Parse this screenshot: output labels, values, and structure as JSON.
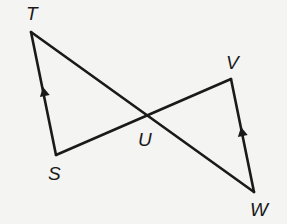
{
  "figure": {
    "type": "geometry",
    "points": {
      "T": {
        "label": "T",
        "x": 31,
        "y": 32,
        "label_x": 26,
        "label_y": 20
      },
      "S": {
        "label": "S",
        "x": 56,
        "y": 155,
        "label_x": 48,
        "label_y": 180
      },
      "U": {
        "label": "U",
        "x": 148,
        "y": 116,
        "label_x": 138,
        "label_y": 146
      },
      "V": {
        "label": "V",
        "x": 231,
        "y": 79,
        "label_x": 226,
        "label_y": 69
      },
      "W": {
        "label": "W",
        "x": 254,
        "y": 192,
        "label_x": 250,
        "label_y": 216
      }
    },
    "segments": [
      {
        "from": "T",
        "to": "W"
      },
      {
        "from": "S",
        "to": "V"
      },
      {
        "from": "T",
        "to": "S"
      },
      {
        "from": "V",
        "to": "W"
      }
    ],
    "parallel_marks": [
      {
        "segment": "TS",
        "x": 44,
        "y": 92,
        "direction": "up"
      },
      {
        "segment": "WV",
        "x": 242,
        "y": 132,
        "direction": "up"
      }
    ],
    "colors": {
      "line": "#1a1a1a",
      "background": "#f4f4f2"
    }
  }
}
